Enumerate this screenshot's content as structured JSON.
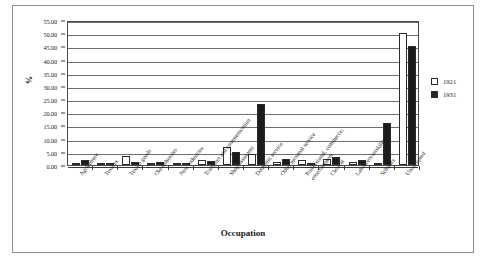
{
  "chart_data": {
    "type": "bar",
    "title": "",
    "xlabel": "Occupation",
    "ylabel": "%",
    "ylim": [
      0,
      55
    ],
    "ytick_step": 5,
    "grid": true,
    "legend_position": "right",
    "ytick_labels": [
      "55.00",
      "50.00",
      "45.00",
      "40.00",
      "35.00",
      "30.00",
      "25.00",
      "20.00",
      "15.00",
      "10.00",
      "5.00",
      "0.00"
    ],
    "categories": [
      "Agriculture",
      "Textiles",
      "Textile goods",
      "Old industries",
      "New industries",
      "Transport and communication",
      "Shop assistants",
      "Domestic service",
      "Other personal service",
      "Professional, commerce, entertainment",
      "Clerical",
      "Labourers/unskilled",
      "Scholars",
      "Unoccupied"
    ],
    "category_lines": [
      [
        "Agriculture"
      ],
      [
        "Textiles"
      ],
      [
        "Textile goods"
      ],
      [
        "Old industries"
      ],
      [
        "New industries"
      ],
      [
        "Transport and communication"
      ],
      [
        "Shop assistants"
      ],
      [
        "Domestic service"
      ],
      [
        "Other personal service"
      ],
      [
        "Professional, commerce,",
        "entertainment"
      ],
      [
        "Clerical"
      ],
      [
        "Labourers/unskilled"
      ],
      [
        "Scholars"
      ],
      [
        "Unoccupied"
      ]
    ],
    "series": [
      {
        "name": "1921",
        "color": "#ffffff",
        "values": [
          0.7,
          0.4,
          3.5,
          0.3,
          0.2,
          1.8,
          7.0,
          4.0,
          1.0,
          2.0,
          2.3,
          1.0,
          0.5,
          50.0
        ]
      },
      {
        "name": "1931",
        "color": "#1b1b1b",
        "values": [
          1.8,
          0.4,
          1.0,
          1.3,
          0.6,
          1.4,
          5.0,
          23.0,
          2.2,
          0.4,
          3.2,
          1.8,
          16.0,
          45.0
        ]
      }
    ]
  },
  "legend": {
    "items": [
      {
        "label": "1921"
      },
      {
        "label": "1931"
      }
    ]
  }
}
